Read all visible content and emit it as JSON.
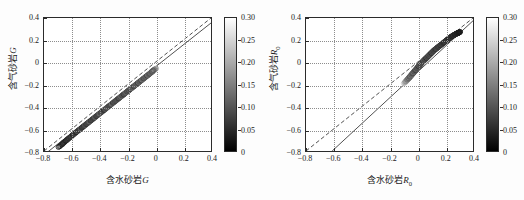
{
  "figure": {
    "background": "#ffffff",
    "panel_count": 2
  },
  "chart_data": [
    {
      "id": "left",
      "type": "scatter",
      "title": "",
      "xlabel": "含水砂岩G",
      "xlabel_text": "含水砂岩",
      "xlabel_symbol": "G",
      "ylabel_text": "含气砂岩",
      "ylabel_symbol": "G",
      "ylabel": "含气砂岩G",
      "xlim": [
        -0.8,
        0.4
      ],
      "ylim": [
        -0.8,
        0.4
      ],
      "xticks": [
        -0.8,
        -0.6,
        -0.4,
        -0.2,
        0,
        0.2,
        0.4
      ],
      "xticklabels": [
        "−0.8",
        "−0.6",
        "−0.4",
        "−0.2",
        "0",
        "0.2",
        "0.4"
      ],
      "yticks": [
        -0.8,
        -0.6,
        -0.4,
        -0.2,
        0,
        0.2,
        0.4
      ],
      "yticklabels": [
        "−0.8",
        "−0.6",
        "−0.4",
        "−0.2",
        "0",
        "0.2",
        "0.4"
      ],
      "grid": true,
      "grid_style": "dotted",
      "marker": "circle-open",
      "marker_size": 2.4,
      "colormap": "gray",
      "colorbar": {
        "min": 0,
        "max": 0.3,
        "ticks": [
          0,
          0.05,
          0.1,
          0.15,
          0.2,
          0.25,
          0.3
        ],
        "ticklabels": [
          "0",
          "0.05",
          "0.10",
          "0.15",
          "0.20",
          "0.25",
          "0.30"
        ],
        "position": "right",
        "low_color": "#000000",
        "high_color": "#ffffff"
      },
      "reference_lines": [
        {
          "name": "unit-slope-dashed",
          "style": "dashed",
          "x0": -0.8,
          "y0": -0.8,
          "x1": 0.4,
          "y1": 0.4
        },
        {
          "name": "regression-solid",
          "style": "solid",
          "x0": -0.8,
          "y0": -0.835,
          "x1": 0.4,
          "y1": 0.355
        }
      ],
      "x": [
        -0.69,
        -0.672,
        -0.661,
        -0.655,
        -0.64,
        -0.632,
        -0.62,
        -0.612,
        -0.604,
        -0.596,
        -0.588,
        -0.58,
        -0.572,
        -0.564,
        -0.556,
        -0.548,
        -0.54,
        -0.532,
        -0.524,
        -0.516,
        -0.508,
        -0.5,
        -0.492,
        -0.484,
        -0.476,
        -0.468,
        -0.46,
        -0.452,
        -0.444,
        -0.436,
        -0.428,
        -0.42,
        -0.412,
        -0.404,
        -0.396,
        -0.388,
        -0.38,
        -0.372,
        -0.364,
        -0.356,
        -0.348,
        -0.34,
        -0.332,
        -0.324,
        -0.316,
        -0.308,
        -0.3,
        -0.292,
        -0.284,
        -0.276,
        -0.268,
        -0.26,
        -0.252,
        -0.246,
        -0.24,
        -0.234,
        -0.228,
        -0.222,
        -0.216,
        -0.21,
        -0.204,
        -0.198,
        -0.192,
        -0.186,
        -0.18,
        -0.174,
        -0.168,
        -0.162,
        -0.156,
        -0.15,
        -0.144,
        -0.138,
        -0.132,
        -0.126,
        -0.12,
        -0.114,
        -0.108,
        -0.102,
        -0.096,
        -0.09,
        -0.084,
        -0.078,
        -0.072,
        -0.066,
        -0.06,
        -0.054,
        -0.048,
        -0.042,
        -0.036,
        -0.03,
        -0.024,
        -0.018,
        -0.012,
        -0.008,
        -0.004,
        -0.002,
        0.0,
        -0.006,
        -0.014,
        -0.02
      ],
      "y": [
        -0.76,
        -0.742,
        -0.728,
        -0.72,
        -0.706,
        -0.696,
        -0.684,
        -0.676,
        -0.668,
        -0.658,
        -0.65,
        -0.642,
        -0.634,
        -0.626,
        -0.618,
        -0.61,
        -0.602,
        -0.594,
        -0.586,
        -0.578,
        -0.57,
        -0.562,
        -0.554,
        -0.546,
        -0.538,
        -0.53,
        -0.522,
        -0.514,
        -0.506,
        -0.498,
        -0.49,
        -0.482,
        -0.474,
        -0.466,
        -0.458,
        -0.45,
        -0.442,
        -0.434,
        -0.426,
        -0.418,
        -0.41,
        -0.402,
        -0.394,
        -0.386,
        -0.378,
        -0.37,
        -0.362,
        -0.354,
        -0.346,
        -0.338,
        -0.33,
        -0.322,
        -0.314,
        -0.308,
        -0.302,
        -0.296,
        -0.29,
        -0.284,
        -0.278,
        -0.272,
        -0.266,
        -0.26,
        -0.254,
        -0.248,
        -0.242,
        -0.236,
        -0.23,
        -0.224,
        -0.218,
        -0.212,
        -0.206,
        -0.2,
        -0.194,
        -0.188,
        -0.182,
        -0.176,
        -0.17,
        -0.164,
        -0.158,
        -0.152,
        -0.146,
        -0.14,
        -0.134,
        -0.128,
        -0.122,
        -0.116,
        -0.11,
        -0.104,
        -0.098,
        -0.092,
        -0.086,
        -0.08,
        -0.074,
        -0.07,
        -0.066,
        -0.062,
        -0.06,
        -0.064,
        -0.072,
        -0.078
      ],
      "c": [
        0.02,
        0.03,
        0.04,
        0.05,
        0.03,
        0.06,
        0.04,
        0.07,
        0.05,
        0.08,
        0.03,
        0.09,
        0.06,
        0.04,
        0.1,
        0.05,
        0.07,
        0.12,
        0.04,
        0.08,
        0.06,
        0.11,
        0.05,
        0.09,
        0.07,
        0.13,
        0.04,
        0.1,
        0.06,
        0.08,
        0.12,
        0.05,
        0.09,
        0.07,
        0.14,
        0.06,
        0.1,
        0.08,
        0.05,
        0.11,
        0.07,
        0.13,
        0.06,
        0.09,
        0.08,
        0.15,
        0.05,
        0.11,
        0.07,
        0.1,
        0.09,
        0.06,
        0.12,
        0.08,
        0.14,
        0.07,
        0.1,
        0.06,
        0.11,
        0.09,
        0.13,
        0.07,
        0.1,
        0.08,
        0.12,
        0.06,
        0.15,
        0.09,
        0.11,
        0.07,
        0.1,
        0.13,
        0.08,
        0.12,
        0.06,
        0.14,
        0.09,
        0.11,
        0.07,
        0.16,
        0.1,
        0.08,
        0.13,
        0.09,
        0.12,
        0.07,
        0.15,
        0.1,
        0.08,
        0.14,
        0.11,
        0.09,
        0.18,
        0.22,
        0.26,
        0.24,
        0.2,
        0.17,
        0.13,
        0.1
      ]
    },
    {
      "id": "right",
      "type": "scatter",
      "title": "",
      "xlabel": "含水砂岩R0",
      "xlabel_text": "含水砂岩",
      "xlabel_symbol": "R",
      "xlabel_subscript": "0",
      "ylabel_text": "含气砂岩",
      "ylabel_symbol": "R",
      "ylabel_subscript": "0",
      "ylabel": "含气砂岩R0",
      "xlim": [
        -0.8,
        0.4
      ],
      "ylim": [
        -0.8,
        0.4
      ],
      "xticks": [
        -0.8,
        -0.6,
        -0.4,
        -0.2,
        0,
        0.2,
        0.4
      ],
      "xticklabels": [
        "−0.8",
        "−0.6",
        "−0.4",
        "−0.2",
        "0",
        "0.2",
        "0.4"
      ],
      "yticks": [
        -0.8,
        -0.6,
        -0.4,
        -0.2,
        0,
        0.2,
        0.4
      ],
      "yticklabels": [
        "−0.8",
        "−0.6",
        "−0.4",
        "−0.2",
        "0",
        "0.2",
        "0.4"
      ],
      "grid": true,
      "grid_style": "dotted",
      "marker": "circle-open",
      "marker_size": 2.4,
      "colormap": "gray",
      "colorbar": {
        "min": 0,
        "max": 0.3,
        "ticks": [
          0,
          0.05,
          0.1,
          0.15,
          0.2,
          0.25,
          0.3
        ],
        "ticklabels": [
          "0",
          "0.05",
          "0.10",
          "0.15",
          "0.20",
          "0.25",
          "0.30"
        ],
        "position": "right",
        "low_color": "#000000",
        "high_color": "#ffffff"
      },
      "reference_lines": [
        {
          "name": "unit-slope-dashed",
          "style": "dashed",
          "x0": -0.8,
          "y0": -0.8,
          "x1": 0.4,
          "y1": 0.4
        },
        {
          "name": "regression-solid",
          "style": "solid",
          "x0": -0.612,
          "y0": -0.8,
          "x1": 0.4,
          "y1": 0.375
        }
      ],
      "x": [
        -0.092,
        -0.086,
        -0.08,
        -0.074,
        -0.068,
        -0.062,
        -0.058,
        -0.054,
        -0.05,
        -0.046,
        -0.042,
        -0.038,
        -0.034,
        -0.03,
        -0.026,
        -0.022,
        -0.018,
        -0.014,
        -0.01,
        -0.006,
        -0.002,
        0.002,
        0.006,
        0.01,
        0.014,
        0.018,
        0.022,
        0.026,
        0.03,
        0.034,
        0.038,
        0.042,
        0.046,
        0.05,
        0.054,
        0.058,
        0.062,
        0.066,
        0.07,
        0.074,
        0.078,
        0.082,
        0.086,
        0.09,
        0.094,
        0.098,
        0.102,
        0.106,
        0.11,
        0.114,
        0.118,
        0.122,
        0.126,
        0.13,
        0.134,
        0.138,
        0.142,
        0.146,
        0.15,
        0.154,
        0.158,
        0.162,
        0.166,
        0.17,
        0.174,
        0.178,
        0.182,
        0.186,
        0.19,
        0.194,
        0.198,
        0.202,
        0.206,
        0.21,
        0.214,
        0.218,
        0.222,
        0.226,
        0.23,
        0.234,
        0.238,
        0.242,
        0.246,
        0.25,
        0.254,
        0.258,
        0.262,
        0.266,
        0.27,
        0.274,
        0.278,
        0.282,
        0.286,
        0.29,
        0.292,
        0.294,
        0.296,
        0.298,
        0.3,
        0.302
      ],
      "y": [
        -0.186,
        -0.178,
        -0.168,
        -0.16,
        -0.152,
        -0.144,
        -0.138,
        -0.132,
        -0.126,
        -0.12,
        -0.114,
        -0.108,
        -0.102,
        -0.096,
        -0.09,
        -0.084,
        -0.078,
        -0.072,
        -0.066,
        -0.06,
        -0.054,
        -0.048,
        -0.042,
        -0.036,
        -0.03,
        -0.024,
        -0.018,
        -0.012,
        -0.006,
        0.0,
        0.005,
        0.01,
        0.015,
        0.02,
        0.025,
        0.03,
        0.035,
        0.04,
        0.045,
        0.05,
        0.055,
        0.06,
        0.065,
        0.07,
        0.075,
        0.08,
        0.085,
        0.09,
        0.095,
        0.1,
        0.105,
        0.11,
        0.114,
        0.118,
        0.122,
        0.126,
        0.13,
        0.134,
        0.138,
        0.142,
        0.146,
        0.15,
        0.154,
        0.158,
        0.162,
        0.166,
        0.17,
        0.174,
        0.178,
        0.182,
        0.186,
        0.19,
        0.194,
        0.198,
        0.202,
        0.206,
        0.21,
        0.214,
        0.218,
        0.222,
        0.226,
        0.23,
        0.233,
        0.236,
        0.239,
        0.242,
        0.245,
        0.248,
        0.251,
        0.254,
        0.257,
        0.26,
        0.262,
        0.264,
        0.265,
        0.266,
        0.267,
        0.268,
        0.269,
        0.27
      ],
      "c": [
        0.24,
        0.2,
        0.16,
        0.18,
        0.12,
        0.14,
        0.1,
        0.16,
        0.08,
        0.12,
        0.15,
        0.09,
        0.13,
        0.07,
        0.11,
        0.14,
        0.08,
        0.12,
        0.06,
        0.1,
        0.13,
        0.07,
        0.11,
        0.09,
        0.05,
        0.12,
        0.08,
        0.1,
        0.06,
        0.13,
        0.07,
        0.11,
        0.05,
        0.09,
        0.12,
        0.06,
        0.1,
        0.08,
        0.04,
        0.11,
        0.07,
        0.09,
        0.05,
        0.12,
        0.06,
        0.1,
        0.08,
        0.04,
        0.11,
        0.07,
        0.09,
        0.05,
        0.1,
        0.06,
        0.08,
        0.04,
        0.11,
        0.07,
        0.09,
        0.05,
        0.08,
        0.06,
        0.1,
        0.04,
        0.07,
        0.09,
        0.05,
        0.08,
        0.06,
        0.04,
        0.07,
        0.05,
        0.09,
        0.06,
        0.04,
        0.08,
        0.05,
        0.07,
        0.03,
        0.06,
        0.04,
        0.08,
        0.05,
        0.07,
        0.03,
        0.06,
        0.04,
        0.05,
        0.07,
        0.03,
        0.05,
        0.04,
        0.06,
        0.03,
        0.05,
        0.04,
        0.03,
        0.05,
        0.04,
        0.03
      ]
    }
  ]
}
